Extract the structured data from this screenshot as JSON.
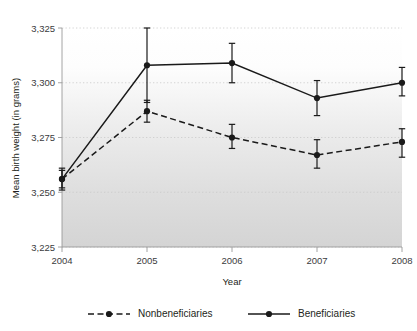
{
  "figure": {
    "cropped_title_fragment": "",
    "background_color": "#ffffff",
    "plot_gradient_top": "#ffffff",
    "plot_gradient_bottom": "#d8d8d8",
    "gridline_color": "#c9c9c9",
    "axis_color": "#9a9a9a",
    "series_color": "#1a1a1a"
  },
  "chart_data": {
    "type": "line",
    "title": "",
    "xlabel": "Year",
    "ylabel": "Mean birth weight (in grams)",
    "categories": [
      "2004",
      "2005",
      "2006",
      "2007",
      "2008"
    ],
    "x": [
      2004,
      2005,
      2006,
      2007,
      2008
    ],
    "ylim": [
      3225,
      3325
    ],
    "yticks": [
      3225,
      3250,
      3275,
      3300,
      3325
    ],
    "ytick_labels": [
      "3,225",
      "3,250",
      "3,275",
      "3,300",
      "3,325"
    ],
    "xtick_labels": [
      "2004",
      "2005",
      "2006",
      "2007",
      "2008"
    ],
    "grid": "horizontal-dotted",
    "legend_position": "bottom",
    "series": [
      {
        "name": "Nonbeneficiaries",
        "style": "dashed",
        "marker": "filled-circle",
        "values": [
          3256,
          3287,
          3275,
          3267,
          3273
        ],
        "error_low": [
          3252,
          3282,
          3270,
          3261,
          3266
        ],
        "error_high": [
          3260,
          3292,
          3281,
          3274,
          3279
        ]
      },
      {
        "name": "Beneficiaries",
        "style": "solid",
        "marker": "filled-circle",
        "values": [
          3256,
          3308,
          3309,
          3293,
          3300
        ],
        "error_low": [
          3251,
          3291,
          3300,
          3285,
          3294
        ],
        "error_high": [
          3261,
          3325,
          3318,
          3301,
          3307
        ]
      }
    ]
  },
  "legend": {
    "items": [
      {
        "label": "Nonbeneficiaries",
        "style": "dashed"
      },
      {
        "label": "Beneficiaries",
        "style": "solid"
      }
    ]
  }
}
